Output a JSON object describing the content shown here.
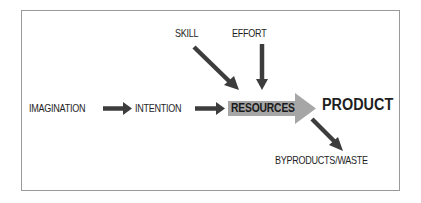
{
  "diagram": {
    "nodes": {
      "imagination": "IMAGINATION",
      "intention": "INTENTION",
      "resources": "RESOURCES",
      "product": "PRODUCT",
      "skill": "SKILL",
      "effort": "EFFORT",
      "byproducts": "BYPRODUCTS/WASTE"
    },
    "edges": [
      {
        "from": "IMAGINATION",
        "to": "INTENTION"
      },
      {
        "from": "INTENTION",
        "to": "RESOURCES"
      },
      {
        "from": "SKILL",
        "to": "RESOURCES"
      },
      {
        "from": "EFFORT",
        "to": "RESOURCES"
      },
      {
        "from": "RESOURCES",
        "to": "PRODUCT"
      },
      {
        "from": "RESOURCES",
        "to": "BYPRODUCTS/WASTE"
      }
    ],
    "colors": {
      "arrow": "#3d3d3d",
      "resources_fill": "#a6a6a6",
      "frame": "#9a9a9a",
      "text": "#1e1e1e"
    }
  }
}
